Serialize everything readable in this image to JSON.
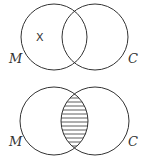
{
  "diagrams": [
    {
      "name": "venn-top",
      "left_label": "M",
      "right_label": "C",
      "mark": "X",
      "mark_region": "M only",
      "shaded_region": "none"
    },
    {
      "name": "venn-bottom",
      "left_label": "M",
      "right_label": "C",
      "shaded_region": "M and C intersection",
      "shading_style": "horizontal lines"
    }
  ],
  "colors": {
    "stroke": "#333333",
    "background": "#ffffff"
  }
}
